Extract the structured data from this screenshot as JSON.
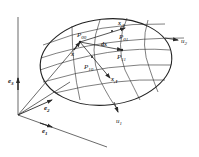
{
  "diagram": {
    "type": "parametric-surface",
    "colors": {
      "line": "#2a2a2a",
      "background": "#ffffff"
    },
    "labels": {
      "P00": {
        "main": "P",
        "sub": "00"
      },
      "P01": {
        "main": "P",
        "sub": "01"
      },
      "P10": {
        "main": "P",
        "sub": "10"
      },
      "P11": {
        "main": "P",
        "sub": "11"
      },
      "x": "x",
      "dx": "dx",
      "x1": {
        "main": "x",
        "sub": ",1"
      },
      "x2": {
        "main": "x",
        "sub": ",2"
      },
      "u1": {
        "main": "u",
        "sub": "1"
      },
      "u2": {
        "main": "u",
        "sub": "2"
      },
      "e1": {
        "main": "e",
        "sub": "1"
      },
      "e2": {
        "main": "e",
        "sub": "2"
      },
      "e3": {
        "main": "e",
        "sub": "3"
      }
    }
  }
}
